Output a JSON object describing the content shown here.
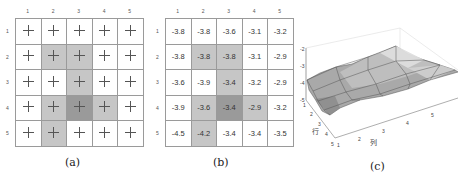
{
  "panel_a": {
    "caption": "(a)",
    "col_labels": [
      "1",
      "2",
      "3",
      "4",
      "5"
    ],
    "row_labels": [
      "1",
      "2",
      "3",
      "4",
      "5"
    ],
    "shading": [
      [
        "none",
        "none",
        "none",
        "none",
        "none"
      ],
      [
        "none",
        "light",
        "light",
        "none",
        "none"
      ],
      [
        "none",
        "none",
        "light",
        "none",
        "none"
      ],
      [
        "none",
        "light",
        "dark",
        "light",
        "none"
      ],
      [
        "none",
        "light",
        "none",
        "none",
        "none"
      ]
    ],
    "cell_marker": "plus-icon"
  },
  "panel_b": {
    "caption": "(b)",
    "col_labels": [
      "1",
      "2",
      "3",
      "4",
      "5"
    ],
    "row_labels": [
      "1",
      "2",
      "3",
      "4",
      "5"
    ],
    "values": [
      [
        "-3.8",
        "-3.8",
        "-3.6",
        "-3.1",
        "-3.2"
      ],
      [
        "-3.8",
        "-3.8",
        "-3.8",
        "-3.1",
        "-2.9"
      ],
      [
        "-3.6",
        "-3.9",
        "-3.4",
        "-3.2",
        "-2.9"
      ],
      [
        "-3.9",
        "-3.6",
        "-3.4",
        "-2.9",
        "-3.2"
      ],
      [
        "-4.5",
        "-4.2",
        "-3.4",
        "-3.4",
        "-3.5"
      ]
    ],
    "shading": [
      [
        "none",
        "none",
        "none",
        "none",
        "none"
      ],
      [
        "none",
        "light",
        "light",
        "none",
        "none"
      ],
      [
        "none",
        "none",
        "light",
        "none",
        "none"
      ],
      [
        "none",
        "light",
        "dark",
        "light",
        "none"
      ],
      [
        "none",
        "light",
        "none",
        "none",
        "none"
      ]
    ]
  },
  "panel_c": {
    "caption": "(c)",
    "z_ticks": [
      "-2",
      "-3",
      "-4",
      "-5"
    ],
    "row_axis_label": "行",
    "row_ticks": [
      "1",
      "2",
      "3",
      "4",
      "5"
    ],
    "col_axis_label": "列",
    "col_ticks": [
      "1",
      "2",
      "3",
      "4",
      "5"
    ]
  },
  "colors": {
    "light": "#c6c6c6",
    "dark": "#9a9a9a",
    "grid_line": "#9a9a9a"
  }
}
